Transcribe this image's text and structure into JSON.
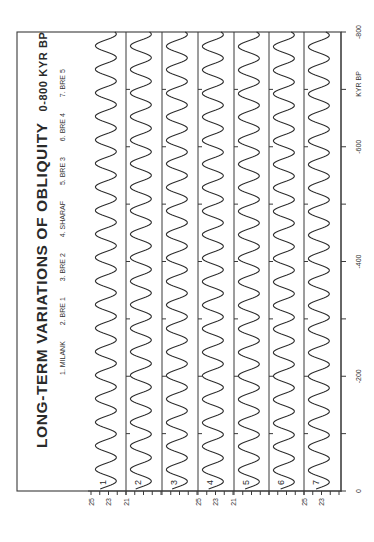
{
  "chart_data": {
    "type": "line",
    "title": "LONG-TERM VARIATIONS OF OBLIQUITY",
    "title_suffix": "0-800 KYR BP",
    "orientation": "rotated-90 (time axis vertical on right, obliquity axis horizontal at bottom)",
    "xlabel": "KYR BP",
    "ylabel": "Obliquity (degrees)",
    "time_axis": {
      "range": [
        -800,
        0
      ],
      "tick_step": 100,
      "tick_labels": [
        "-800",
        "-600",
        "-400",
        "-200",
        "0"
      ],
      "label": "KYR BP"
    },
    "obliquity_axis": {
      "range": [
        21,
        25
      ],
      "tick_labels_groups": [
        [
          "25",
          "23",
          "21"
        ],
        [
          "25",
          "23",
          "21"
        ],
        [
          "25",
          "23"
        ]
      ]
    },
    "legend": [
      "1. MILANK",
      "2. BRE 1",
      "3. BRE 2",
      "4. SHARAF",
      "5. BRE 3",
      "6. BRE 4",
      "7. BRE 5"
    ],
    "series": [
      {
        "name": "MILANK",
        "number": "1",
        "period_kyr": 41,
        "mean": 23.3,
        "amplitude": 1.2
      },
      {
        "name": "BRE 1",
        "number": "2",
        "period_kyr": 41,
        "mean": 23.3,
        "amplitude": 1.2
      },
      {
        "name": "BRE 2",
        "number": "3",
        "period_kyr": 41,
        "mean": 23.3,
        "amplitude": 1.2
      },
      {
        "name": "SHARAF",
        "number": "4",
        "period_kyr": 41,
        "mean": 23.3,
        "amplitude": 1.2
      },
      {
        "name": "BRE 3",
        "number": "5",
        "period_kyr": 41,
        "mean": 23.3,
        "amplitude": 1.2
      },
      {
        "name": "BRE 4",
        "number": "6",
        "period_kyr": 41,
        "mean": 23.3,
        "amplitude": 1.2
      },
      {
        "name": "BRE 5",
        "number": "7",
        "period_kyr": 41,
        "mean": 23.3,
        "amplitude": 1.2
      }
    ],
    "grid": false
  },
  "layout": {
    "frame": {
      "left": 17,
      "right": 341,
      "top": 32,
      "bottom": 491
    },
    "strip_left_edges": [
      91,
      126,
      162,
      198,
      234,
      269,
      304
    ],
    "strip_width": 36,
    "dividers": [
      126,
      162,
      198,
      234,
      269,
      304
    ],
    "colors": {
      "ink": "#2e2e2e",
      "background": "#ffffff"
    }
  }
}
